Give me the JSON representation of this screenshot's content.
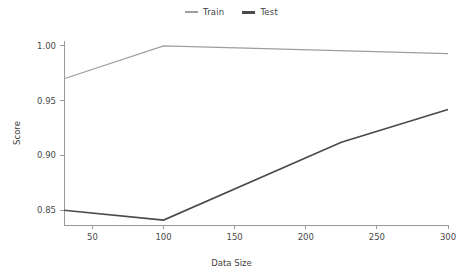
{
  "chart_data": {
    "type": "line",
    "title": "",
    "xlabel": "Data Size",
    "ylabel": "Score",
    "xlim": [
      30,
      300
    ],
    "ylim": [
      0.8365,
      1.0045
    ],
    "grid": false,
    "legend_position": "top-center",
    "xticks": [
      50,
      100,
      150,
      200,
      250,
      300
    ],
    "xtick_labels": [
      "50",
      "100",
      "150",
      "200",
      "250",
      "300"
    ],
    "yticks": [
      0.85,
      0.9,
      0.95,
      1.0
    ],
    "ytick_labels": [
      "0.85",
      "0.90",
      "0.95",
      "1.00"
    ],
    "series": [
      {
        "name": "Train",
        "color": "#9d9d9d",
        "linewidth": 1.2,
        "x": [
          30,
          100,
          300
        ],
        "values": [
          0.97,
          1.0,
          0.993
        ]
      },
      {
        "name": "Test",
        "color": "#4a4a4a",
        "linewidth": 1.6,
        "x": [
          30,
          100,
          225,
          300
        ],
        "values": [
          0.85,
          0.841,
          0.912,
          0.942
        ]
      }
    ]
  },
  "legend": {
    "entries": [
      {
        "label": "Train",
        "color": "#9d9d9d"
      },
      {
        "label": "Test",
        "color": "#4a4a4a"
      }
    ]
  },
  "axes": {
    "x_title": "Data Size",
    "y_title": "Score",
    "x_tick_labels": [
      "50",
      "100",
      "150",
      "200",
      "250",
      "300"
    ],
    "y_tick_labels": [
      "1.00",
      "0.95",
      "0.90",
      "0.85"
    ]
  }
}
